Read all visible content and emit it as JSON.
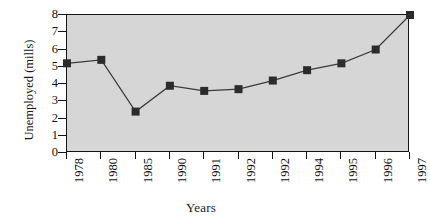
{
  "chart_data": {
    "type": "line",
    "title": "",
    "xlabel": "Years",
    "ylabel": "Unemployed (mills)",
    "categories": [
      "1978",
      "1980",
      "1985",
      "1990",
      "1991",
      "1992",
      "1992",
      "1994",
      "1995",
      "1996",
      "1997"
    ],
    "values": [
      5.2,
      5.4,
      2.4,
      3.9,
      3.6,
      3.7,
      4.2,
      4.8,
      5.2,
      6.0,
      8.0
    ],
    "ylim": [
      0,
      8
    ],
    "yticks": [
      "0",
      "1",
      "2",
      "3",
      "4",
      "5",
      "6",
      "7",
      "8"
    ],
    "ytick_values": [
      0,
      1,
      2,
      3,
      4,
      5,
      6,
      7,
      8
    ],
    "grid": false,
    "legend": "none",
    "marker": "square",
    "series": [
      {
        "name": "Unemployed (mills)",
        "values": [
          5.2,
          5.4,
          2.4,
          3.9,
          3.6,
          3.7,
          4.2,
          4.8,
          5.2,
          6.0,
          8.0
        ]
      }
    ]
  },
  "style": {
    "plot_background": "#d6d6d6",
    "page_background": "#ffffff",
    "axis_color": "#141414",
    "line_color": "#3a3a3a",
    "marker_color": "#2b2b2b",
    "text_color": "#111111"
  }
}
